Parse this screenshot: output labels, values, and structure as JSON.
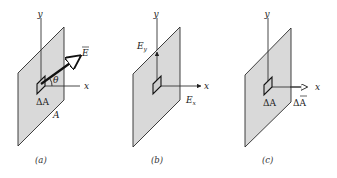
{
  "figure": {
    "panels": [
      {
        "id": "a",
        "caption": "(a)",
        "axis_labels": {
          "y": "y",
          "x": "x"
        },
        "vector_label": "E",
        "angle_label": "θ",
        "patch_label": "ΔA",
        "plane_label": "A"
      },
      {
        "id": "b",
        "caption": "(b)",
        "axis_labels": {
          "y": "y",
          "x": "x"
        },
        "component_y": "E",
        "component_y_sub": "y",
        "component_x": "E",
        "component_x_sub": "x"
      },
      {
        "id": "c",
        "caption": "(c)",
        "axis_labels": {
          "y": "y",
          "x": "x"
        },
        "patch_label": "ΔA",
        "vector_label": "ΔA"
      }
    ],
    "colors": {
      "plane_fill": "#d9d9d9",
      "stroke": "#222222",
      "background": "#ffffff"
    }
  }
}
